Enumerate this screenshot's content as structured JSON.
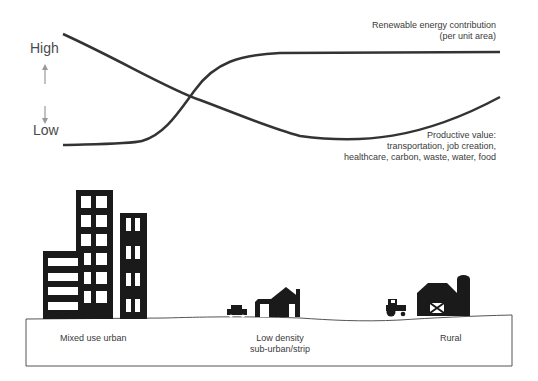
{
  "axis": {
    "high_label": "High",
    "low_label": "Low",
    "up_arrow": "arrow-up-icon",
    "down_arrow": "arrow-down-icon"
  },
  "curves": {
    "renewable": {
      "label_line1": "Renewable energy contribution",
      "label_line2": "(per unit area)"
    },
    "productive": {
      "label_line1": "Productive value:",
      "label_line2": "transportation, job creation,",
      "label_line3": "healthcare, carbon, waste, water, food"
    }
  },
  "zones": [
    {
      "label": "Mixed use urban"
    },
    {
      "label_line1": "Low density",
      "label_line2": "sub-urban/strip"
    },
    {
      "label": "Rural"
    }
  ],
  "colors": {
    "line": "#333333",
    "building": "#1a1a1a",
    "text": "#3a3a3a",
    "arrow": "#999999"
  }
}
